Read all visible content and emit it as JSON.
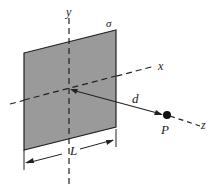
{
  "diagram": {
    "labels": {
      "y_axis": "y",
      "x_axis": "x",
      "z_axis": "z",
      "sigma": "σ",
      "distance": "d",
      "point": "P",
      "side_length": "L"
    },
    "colors": {
      "plate_fill": "#9a9a9a",
      "line": "#222222",
      "background": "#ffffff"
    }
  }
}
